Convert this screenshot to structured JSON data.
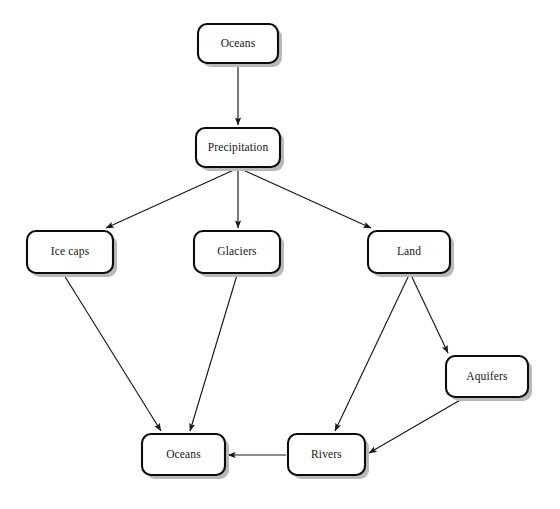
{
  "diagram": {
    "background_color": "#ffffff",
    "node_fill_color": "#ffffff",
    "node_border_color": "#0b0c0e",
    "node_shadow_color": "#b9b9bb",
    "edge_color": "#17181c",
    "nodes": [
      {
        "id": "oceans-top",
        "label": "Oceans",
        "x": 198,
        "y": 24,
        "w": 80,
        "h": 39
      },
      {
        "id": "precipitation",
        "label": "Precipitation",
        "x": 196,
        "y": 128,
        "w": 84,
        "h": 39
      },
      {
        "id": "ice-caps",
        "label": "Ice caps",
        "x": 27,
        "y": 231,
        "w": 86,
        "h": 42
      },
      {
        "id": "glaciers",
        "label": "Glaciers",
        "x": 194,
        "y": 231,
        "w": 86,
        "h": 42
      },
      {
        "id": "land",
        "label": "Land",
        "x": 368,
        "y": 231,
        "w": 82,
        "h": 42
      },
      {
        "id": "aquifers",
        "label": "Aquifers",
        "x": 446,
        "y": 356,
        "w": 82,
        "h": 41
      },
      {
        "id": "oceans-bottom",
        "label": "Oceans",
        "x": 142,
        "y": 434,
        "w": 83,
        "h": 41
      },
      {
        "id": "rivers",
        "label": "Rivers",
        "x": 288,
        "y": 434,
        "w": 77,
        "h": 41
      }
    ],
    "edges": [
      {
        "id": "oceans-top-to-precipitation",
        "from": "oceans-top",
        "to": "precipitation",
        "x1": 238,
        "y1": 64,
        "x2": 238,
        "y2": 125
      },
      {
        "id": "precipitation-to-ice-caps",
        "from": "precipitation",
        "to": "ice-caps",
        "x1": 236,
        "y1": 169,
        "x2": 106,
        "y2": 228
      },
      {
        "id": "precipitation-to-glaciers",
        "from": "precipitation",
        "to": "glaciers",
        "x1": 238,
        "y1": 169,
        "x2": 238,
        "y2": 228
      },
      {
        "id": "precipitation-to-land",
        "from": "precipitation",
        "to": "land",
        "x1": 241,
        "y1": 169,
        "x2": 371,
        "y2": 228
      },
      {
        "id": "ice-caps-to-oceans-bottom",
        "from": "ice-caps",
        "to": "oceans-bottom",
        "x1": 64,
        "y1": 275,
        "x2": 161,
        "y2": 431
      },
      {
        "id": "glaciers-to-oceans-bottom",
        "from": "glaciers",
        "to": "oceans-bottom",
        "x1": 237,
        "y1": 275,
        "x2": 190,
        "y2": 431
      },
      {
        "id": "land-to-rivers",
        "from": "land",
        "to": "rivers",
        "x1": 409,
        "y1": 275,
        "x2": 335,
        "y2": 431
      },
      {
        "id": "land-to-aquifers",
        "from": "land",
        "to": "aquifers",
        "x1": 411,
        "y1": 275,
        "x2": 448,
        "y2": 353
      },
      {
        "id": "aquifers-to-rivers",
        "from": "aquifers",
        "to": "rivers",
        "x1": 462,
        "y1": 399,
        "x2": 369,
        "y2": 453
      },
      {
        "id": "rivers-to-oceans-bottom",
        "from": "rivers",
        "to": "oceans-bottom",
        "x1": 286,
        "y1": 455,
        "x2": 228,
        "y2": 455
      }
    ]
  }
}
